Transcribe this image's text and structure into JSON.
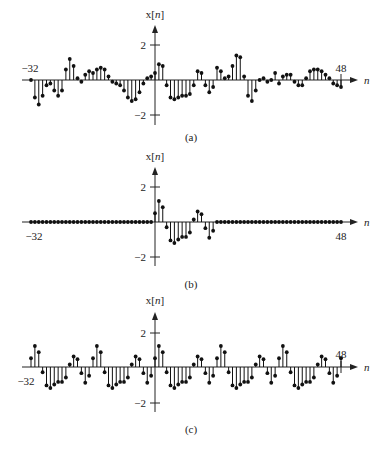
{
  "chart_data": [
    {
      "type": "stem",
      "panel": "(a)",
      "ylabel": "x[n]",
      "xlabel": "n",
      "x_start": -32,
      "x_end": 48,
      "x_tick_labels": [
        "-32",
        "48"
      ],
      "y_tick_labels": [
        "2",
        "-2"
      ],
      "ylim": [
        -2,
        2
      ],
      "values": [
        0.0,
        -1.0,
        -1.4,
        -0.9,
        -0.3,
        -0.2,
        -0.6,
        -0.9,
        -0.6,
        0.6,
        1.2,
        0.8,
        0.1,
        -0.1,
        0.3,
        0.5,
        0.4,
        0.6,
        0.7,
        0.6,
        0.2,
        -0.1,
        -0.2,
        -0.3,
        -0.6,
        -1.0,
        -1.2,
        -1.1,
        -0.7,
        -0.2,
        0.1,
        0.2,
        0.4,
        0.9,
        0.8,
        -0.3,
        -1.0,
        -1.1,
        -1.0,
        -0.9,
        -0.9,
        -0.8,
        -0.3,
        0.5,
        0.4,
        -0.3,
        -0.7,
        -0.4,
        0.7,
        0.5,
        0.1,
        0.2,
        0.8,
        1.4,
        1.3,
        0.2,
        -0.9,
        -1.2,
        -0.6,
        0.0,
        0.1,
        -0.1,
        0.0,
        0.4,
        -0.2,
        0.2,
        0.3,
        0.3,
        -0.1,
        -0.3,
        -0.3,
        0.1,
        0.5,
        0.6,
        0.6,
        0.5,
        0.3,
        0.1,
        -0.2,
        -0.3,
        -0.4
      ]
    },
    {
      "type": "stem",
      "panel": "(b)",
      "ylabel": "x[n]",
      "xlabel": "n",
      "x_start": -32,
      "x_end": 48,
      "x_tick_labels": [
        "-32",
        "48"
      ],
      "y_tick_labels": [
        "2",
        "-2"
      ],
      "ylim": [
        -2,
        2
      ],
      "nonzero_from": 0,
      "values": [
        0.5,
        1.2,
        0.85,
        -0.3,
        -1.05,
        -1.2,
        -1.0,
        -0.85,
        -0.85,
        -0.6,
        0.15,
        0.6,
        0.45,
        -0.35,
        -0.9,
        -0.5
      ]
    },
    {
      "type": "stem",
      "panel": "(c)",
      "ylabel": "x[n]",
      "xlabel": "n",
      "x_start": -32,
      "x_end": 48,
      "x_tick_labels": [
        "-32",
        "48"
      ],
      "y_tick_labels": [
        "2",
        "-2"
      ],
      "ylim": [
        -2,
        2
      ],
      "period": 16,
      "one_period_from_n0": [
        0.5,
        1.2,
        0.85,
        -0.3,
        -1.05,
        -1.2,
        -1.0,
        -0.85,
        -0.85,
        -0.6,
        0.15,
        0.6,
        0.45,
        -0.35,
        -0.9,
        -0.5
      ]
    }
  ],
  "panels": {
    "a": {
      "caption": "(a)",
      "ylabel": "x[n]",
      "xlabel": "n",
      "tick_pos": "2",
      "tick_neg": "−2",
      "left": "−32",
      "right": "48"
    },
    "b": {
      "caption": "(b)",
      "ylabel": "x[n]",
      "xlabel": "n",
      "tick_pos": "2",
      "tick_neg": "−2",
      "left": "−32",
      "right": "48"
    },
    "c": {
      "caption": "(c)",
      "ylabel": "x[n]",
      "xlabel": "n",
      "tick_pos": "2",
      "tick_neg": "−2",
      "left": "−32",
      "right": "48"
    }
  }
}
